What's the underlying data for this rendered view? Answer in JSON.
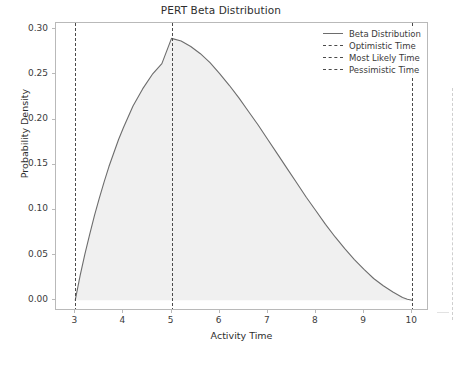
{
  "chart_data": {
    "type": "area",
    "title": "PERT Beta Distribution",
    "xlabel": "Activity Time",
    "ylabel": "Probability Density",
    "xlim": [
      2.6,
      10.35
    ],
    "ylim": [
      -0.012,
      0.307
    ],
    "grid": false,
    "legend_position": "upper right",
    "xticks": [
      "3",
      "4",
      "5",
      "6",
      "7",
      "8",
      "9",
      "10"
    ],
    "xtick_values": [
      3,
      4,
      5,
      6,
      7,
      8,
      9,
      10
    ],
    "yticks": [
      "0.00",
      "0.05",
      "0.10",
      "0.15",
      "0.20",
      "0.25",
      "0.30"
    ],
    "ytick_values": [
      0.0,
      0.05,
      0.1,
      0.15,
      0.2,
      0.25,
      0.3
    ],
    "series": [
      {
        "name": "Beta Distribution",
        "style": "solid",
        "color": "#6d6d6d",
        "fill": "#f0f0f0",
        "x": [
          3.0,
          3.1,
          3.2,
          3.3,
          3.4,
          3.5,
          3.6,
          3.7,
          3.8,
          3.9,
          4.0,
          4.2,
          4.4,
          4.6,
          4.8,
          5.0,
          5.2,
          5.4,
          5.6,
          5.8,
          6.0,
          6.2,
          6.4,
          6.6,
          6.8,
          7.0,
          7.2,
          7.4,
          7.6,
          7.8,
          8.0,
          8.2,
          8.4,
          8.6,
          8.8,
          9.0,
          9.2,
          9.4,
          9.6,
          9.8,
          9.9,
          10.0
        ],
        "y": [
          0.0,
          0.027,
          0.051,
          0.073,
          0.094,
          0.113,
          0.131,
          0.148,
          0.163,
          0.178,
          0.191,
          0.215,
          0.234,
          0.25,
          0.262,
          0.29,
          0.287,
          0.281,
          0.273,
          0.263,
          0.251,
          0.238,
          0.224,
          0.209,
          0.194,
          0.178,
          0.162,
          0.146,
          0.13,
          0.114,
          0.099,
          0.084,
          0.07,
          0.057,
          0.045,
          0.034,
          0.024,
          0.016,
          0.009,
          0.003,
          0.001,
          0.0
        ]
      }
    ],
    "vlines": [
      {
        "name": "Optimistic Time",
        "x": 3,
        "style": "dashed",
        "color": "#4a4a4a"
      },
      {
        "name": "Most Likely Time",
        "x": 5,
        "style": "dashed",
        "color": "#4a4a4a"
      },
      {
        "name": "Pessimistic Time",
        "x": 10,
        "style": "dashed",
        "color": "#4a4a4a"
      }
    ],
    "legend": [
      {
        "label": "Beta Distribution",
        "style": "solid"
      },
      {
        "label": "Optimistic Time",
        "style": "dashed"
      },
      {
        "label": "Most Likely Time",
        "style": "dashed"
      },
      {
        "label": "Pessimistic Time",
        "style": "dashed"
      }
    ],
    "peak": {
      "x": 5,
      "y": 0.29
    }
  },
  "colors": {
    "curve": "#6d6d6d",
    "fill": "#f0f0f0",
    "vline": "#4a4a4a",
    "axis": "#b9b9b9",
    "text": "#3b3b3b",
    "background": "#ffffff"
  }
}
